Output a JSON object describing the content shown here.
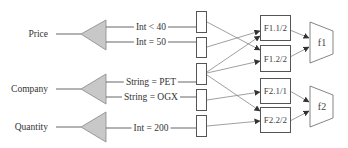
{
  "inputs": [
    {
      "label": "Price",
      "y": 34
    },
    {
      "label": "Company",
      "y": 89
    },
    {
      "label": "Quantity",
      "y": 127
    }
  ],
  "conditions": [
    {
      "label": "Int < 40",
      "y": 27,
      "x": 150
    },
    {
      "label": "Int = 50",
      "y": 42,
      "x": 150
    },
    {
      "label": "String = PET",
      "y": 82,
      "x": 150
    },
    {
      "label": "String = OGX",
      "y": 97,
      "x": 150
    },
    {
      "label": "Int = 200",
      "y": 128,
      "x": 150
    }
  ],
  "fragments": [
    {
      "label": "F1.1/2",
      "y": 15,
      "h": 25
    },
    {
      "label": "F1.2/2",
      "y": 45,
      "h": 26
    },
    {
      "label": "F2.1/1",
      "y": 78,
      "h": 25
    },
    {
      "label": "F2.2/2",
      "y": 107,
      "h": 25
    }
  ],
  "functions": [
    {
      "label": "f1",
      "cy": 42
    },
    {
      "label": "f2",
      "cy": 106
    }
  ],
  "colors": {
    "triangle_fill": "#c8c8c8",
    "line": "#666666",
    "arrow_line": "#888888",
    "arrow_head": "#333333"
  }
}
